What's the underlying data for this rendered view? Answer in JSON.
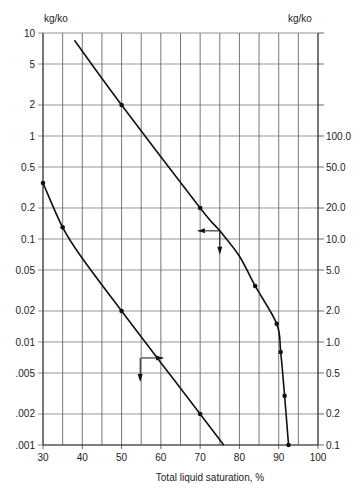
{
  "chart_data": {
    "type": "line",
    "title": "",
    "xlabel": "Total liquid saturation, %",
    "ylabel_left": "kg/ko",
    "ylabel_right": "kg/ko",
    "xlim": [
      30,
      100
    ],
    "ylim_left": [
      0.001,
      10
    ],
    "ylim_right": [
      0.1,
      1000
    ],
    "yscale": "log",
    "grid": true,
    "x_ticks": [
      30,
      40,
      50,
      60,
      70,
      80,
      90,
      100
    ],
    "x_tick_labels": [
      "30",
      "40",
      "50",
      "60",
      "70",
      "80",
      "90",
      "100"
    ],
    "x_minor_grid": [
      35,
      45,
      55,
      65,
      75,
      85,
      95
    ],
    "left_y_ticks": [
      10,
      5,
      2,
      1,
      0.5,
      0.2,
      0.1,
      0.05,
      0.02,
      0.01,
      0.005,
      0.002,
      0.001
    ],
    "left_y_tick_labels": [
      "10",
      "5",
      "2",
      "1",
      "0.5",
      "0.2",
      "0.1",
      "0.05",
      "0.02",
      "0.01",
      ".005",
      ".002",
      ".001"
    ],
    "right_y_ticks": [
      100,
      50,
      20,
      10,
      5,
      2,
      1,
      0.5,
      0.2,
      0.1
    ],
    "right_y_tick_labels": [
      "100.0",
      "50.0",
      "20.0",
      "10.0",
      "5.0",
      "2.0",
      "1.0",
      "0.5",
      "0.2",
      "0.1"
    ],
    "series": [
      {
        "name": "Upper curve (straight part read on left axis, steep tail read on right axis)",
        "axis": "left",
        "x": [
          38,
          50,
          70,
          75,
          80,
          84,
          89.5,
          90.5,
          91.5,
          92.5
        ],
        "y": [
          8.5,
          2,
          0.2,
          0.12,
          0.068,
          0.035,
          0.015,
          0.008,
          0.003,
          0.001
        ],
        "y_right_equivalent": [
          850,
          200,
          20,
          12,
          6.8,
          3.5,
          1.5,
          0.8,
          0.3,
          0.1
        ],
        "markers_x": [
          50,
          70,
          84,
          89.5,
          90.5,
          91.5,
          92.5
        ],
        "arrow_annotation": {
          "x": 75,
          "y_left": 0.12,
          "direction": [
            "left",
            "down"
          ]
        }
      },
      {
        "name": "Lower curve (read on left axis)",
        "axis": "left",
        "x": [
          30,
          35,
          40,
          50,
          60,
          70,
          76
        ],
        "y": [
          0.35,
          0.13,
          0.065,
          0.02,
          0.0063,
          0.002,
          0.001
        ],
        "markers_x": [
          30,
          35,
          50,
          70
        ],
        "arrow_annotation": {
          "x": 55,
          "y_left": 0.007,
          "direction": [
            "right",
            "down"
          ]
        }
      }
    ]
  }
}
